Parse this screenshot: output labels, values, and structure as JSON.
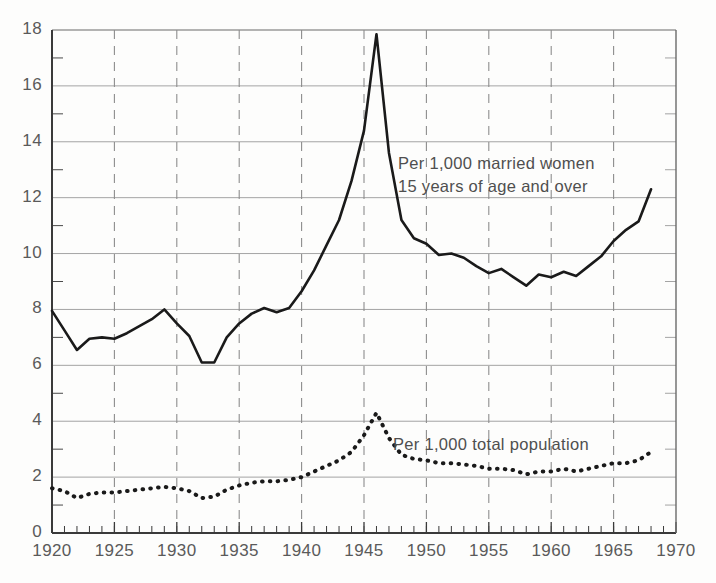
{
  "chart_data": {
    "type": "line",
    "title": "",
    "subtitle": "",
    "xlabel": "",
    "ylabel": "",
    "xlim": [
      1920,
      1970
    ],
    "ylim": [
      0,
      18
    ],
    "grid": "horizontal gridlines at every even y value; dashed vertical gridlines at every 5th year",
    "legend_position": "inline annotations next to each curve",
    "x_ticks": [
      "1920",
      "1925",
      "1930",
      "1935",
      "1940",
      "1945",
      "1950",
      "1955",
      "1960",
      "1965",
      "1970"
    ],
    "x_tick_values": [
      1920,
      1925,
      1930,
      1935,
      1940,
      1945,
      1950,
      1955,
      1960,
      1965,
      1970
    ],
    "x_minor_tick_interval": 1,
    "y_ticks": [
      "0",
      "2",
      "4",
      "6",
      "8",
      "10",
      "12",
      "14",
      "16",
      "18"
    ],
    "y_tick_values": [
      0,
      2,
      4,
      6,
      8,
      10,
      12,
      14,
      16,
      18
    ],
    "y_minor_tick_interval": 1,
    "x": [
      1920,
      1921,
      1922,
      1923,
      1924,
      1925,
      1926,
      1927,
      1928,
      1929,
      1930,
      1931,
      1932,
      1933,
      1934,
      1935,
      1936,
      1937,
      1938,
      1939,
      1940,
      1941,
      1942,
      1943,
      1944,
      1945,
      1946,
      1947,
      1948,
      1949,
      1950,
      1951,
      1952,
      1953,
      1954,
      1955,
      1956,
      1957,
      1958,
      1959,
      1960,
      1961,
      1962,
      1963,
      1964,
      1965,
      1966,
      1967,
      1968
    ],
    "series": [
      {
        "name": "Per 1,000 married women 15 years of age and over",
        "label_line1": "Per 1,000 married women",
        "label_line2": "15 years of age and over",
        "style": "solid",
        "color": "#1a1a1a",
        "values": [
          7.95,
          7.25,
          6.55,
          6.95,
          7.0,
          6.95,
          7.15,
          7.4,
          7.65,
          8.0,
          7.5,
          7.05,
          6.1,
          6.1,
          7.0,
          7.5,
          7.85,
          8.05,
          7.9,
          8.05,
          8.65,
          9.4,
          10.3,
          11.2,
          12.6,
          14.4,
          17.85,
          13.6,
          11.2,
          10.55,
          10.35,
          9.95,
          10.0,
          9.85,
          9.55,
          9.3,
          9.45,
          9.15,
          8.85,
          9.25,
          9.15,
          9.35,
          9.2,
          9.55,
          9.9,
          10.45,
          10.85,
          11.15,
          12.3
        ]
      },
      {
        "name": "Per 1,000 total population",
        "label_line1": "Per 1,000 total population",
        "style": "dotted",
        "color": "#1a1a1a",
        "values": [
          1.6,
          1.5,
          1.25,
          1.4,
          1.45,
          1.45,
          1.5,
          1.55,
          1.6,
          1.65,
          1.6,
          1.5,
          1.25,
          1.3,
          1.55,
          1.7,
          1.8,
          1.85,
          1.85,
          1.9,
          2.0,
          2.2,
          2.4,
          2.6,
          2.9,
          3.5,
          4.3,
          3.4,
          2.8,
          2.65,
          2.6,
          2.5,
          2.5,
          2.45,
          2.4,
          2.3,
          2.3,
          2.25,
          2.1,
          2.2,
          2.2,
          2.3,
          2.2,
          2.3,
          2.4,
          2.5,
          2.5,
          2.6,
          2.9
        ]
      }
    ]
  },
  "axes": {
    "x_axis_name": "year-axis",
    "y_axis_name": "rate-axis"
  }
}
